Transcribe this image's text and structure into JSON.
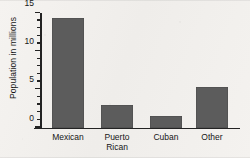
{
  "chart_data": {
    "type": "bar",
    "title": "",
    "xlabel": "",
    "ylabel": "Population in millions",
    "categories": [
      "Mexican",
      "Puerto Rican",
      "Cuban",
      "Other"
    ],
    "category_lines": [
      [
        "Mexican"
      ],
      [
        "Puerto",
        "Rican"
      ],
      [
        "Cuban"
      ],
      [
        "Other"
      ]
    ],
    "values": [
      14.1,
      2.7,
      1.3,
      5.1
    ],
    "ylim": [
      0,
      15
    ],
    "ytick_labels": [
      "0",
      "5",
      "10",
      "15"
    ],
    "ytick_values": [
      0,
      5,
      10,
      15
    ],
    "yminor_step": 1,
    "grid": false,
    "legend": null,
    "bar_color": "#5c5c5c",
    "axis_color": "#232323",
    "background_color": "#f3f1ee"
  }
}
